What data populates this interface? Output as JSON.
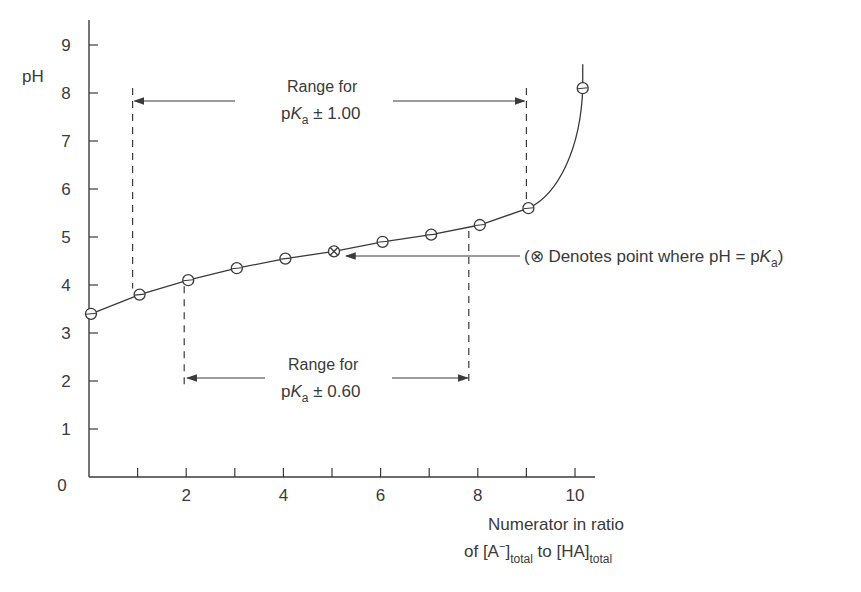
{
  "chart_data": {
    "type": "line",
    "title": "",
    "xlabel_line1": "Numerator in ratio",
    "xlabel_line2": "of [A⁻]total to [HA]total",
    "ylabel": "pH",
    "xlim": [
      0,
      10.4
    ],
    "ylim": [
      0,
      9.5
    ],
    "x_ticks": [
      1,
      2,
      3,
      4,
      5,
      6,
      7,
      8,
      9,
      10
    ],
    "x_tick_labels": [
      {
        "x": 2,
        "label": "2"
      },
      {
        "x": 4,
        "label": "4"
      },
      {
        "x": 6,
        "label": "6"
      },
      {
        "x": 8,
        "label": "8"
      },
      {
        "x": 10,
        "label": "10"
      }
    ],
    "y_ticks": [
      0,
      1,
      2,
      3,
      4,
      5,
      6,
      7,
      8,
      9
    ],
    "y_tick_labels": [
      "0",
      "1",
      "2",
      "3",
      "4",
      "5",
      "6",
      "7",
      "8",
      "9"
    ],
    "grid": false,
    "series": [
      {
        "name": "Titration curve",
        "x": [
          0,
          1,
          2,
          3,
          4,
          5,
          6,
          7,
          8,
          9,
          10.2
        ],
        "values": [
          3.4,
          3.8,
          4.1,
          4.35,
          4.55,
          4.7,
          4.9,
          5.05,
          5.25,
          5.6,
          8.1
        ],
        "marker": "open-circle",
        "special_point": {
          "x": 5,
          "y": 4.7,
          "marker": "circled-x",
          "meaning": "pH = pKa"
        }
      }
    ],
    "annotations": [
      {
        "text_line1": "Range for",
        "text_line2_prefix": "p",
        "text_line2_K": "K",
        "text_line2_sub": "a",
        "text_line2_suffix": " ± 1.00",
        "x_from": 1,
        "x_to": 9,
        "y": 7.8
      },
      {
        "text_line1": "Range for",
        "text_line2_prefix": "p",
        "text_line2_K": "K",
        "text_line2_sub": "a",
        "text_line2_suffix": " ± 0.60",
        "x_from": 2,
        "x_to": 8,
        "y": 2.0
      },
      {
        "text_prefix": "(⊗ Denotes point where pH = p",
        "text_K": "K",
        "text_sub": "a",
        "text_suffix": ")",
        "points_to": {
          "x": 5,
          "y": 4.7
        }
      }
    ],
    "colors": {
      "ink": "#3a3a3a",
      "background": "#ffffff"
    }
  },
  "axis": {
    "xlabel_line1": "Numerator in ratio",
    "xlabel_of": "of [A",
    "xlabel_minus": "−",
    "xlabel_close": "]",
    "xlabel_sub1": "total",
    "xlabel_to": " to [HA]",
    "xlabel_sub2": "total",
    "ylabel": "pH"
  },
  "range1": {
    "line1": "Range for",
    "p": "p",
    "K": "K",
    "sub": "a",
    "suffix": " ± 1.00"
  },
  "range2": {
    "line1": "Range for",
    "p": "p",
    "K": "K",
    "sub": "a",
    "suffix": " ± 0.60"
  },
  "note": {
    "prefix": "(⊗ Denotes point where pH = p",
    "K": "K",
    "sub": "a",
    "suffix": ")"
  }
}
